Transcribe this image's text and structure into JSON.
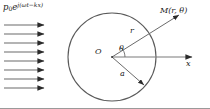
{
  "figure": {
    "name": "acoustic-scattering-cylinder-diagram",
    "background_color": "#ffffff",
    "stroke_color": "#4d4d4d",
    "text_color": "#1a1a1a",
    "border": {
      "bottom_color": "#9a9a9a"
    }
  },
  "labels": {
    "incident_wave": {
      "base": "p",
      "subscript": "0",
      "exponential": "e",
      "exponent": "j(ωt−kx)",
      "full": "p₀e^{j(ωt−kx)}"
    },
    "field_point": "M(r, θ)",
    "origin": "O",
    "radial_distance": "r",
    "angle": "θ",
    "cylinder_radius": "a",
    "x_axis": "x"
  },
  "geometry": {
    "circle": {
      "cx": 112,
      "cy": 57,
      "r": 44
    },
    "origin_point": {
      "x": 112,
      "y": 57
    },
    "x_axis_arrow": {
      "x1": 112,
      "y1": 57,
      "x2": 196,
      "y2": 57
    },
    "r_ray": {
      "x1": 112,
      "y1": 57,
      "x2": 182,
      "y2": 13
    },
    "a_ray": {
      "x1": 112,
      "y1": 57,
      "x2": 147,
      "y2": 87
    },
    "theta_arc": {
      "cx": 112,
      "cy": 57,
      "radius": 13
    },
    "incident_arrows": {
      "count": 8,
      "x_start": 4,
      "x_end": 47,
      "y_values": [
        25,
        34,
        43,
        52,
        61,
        70,
        79,
        88
      ]
    }
  }
}
